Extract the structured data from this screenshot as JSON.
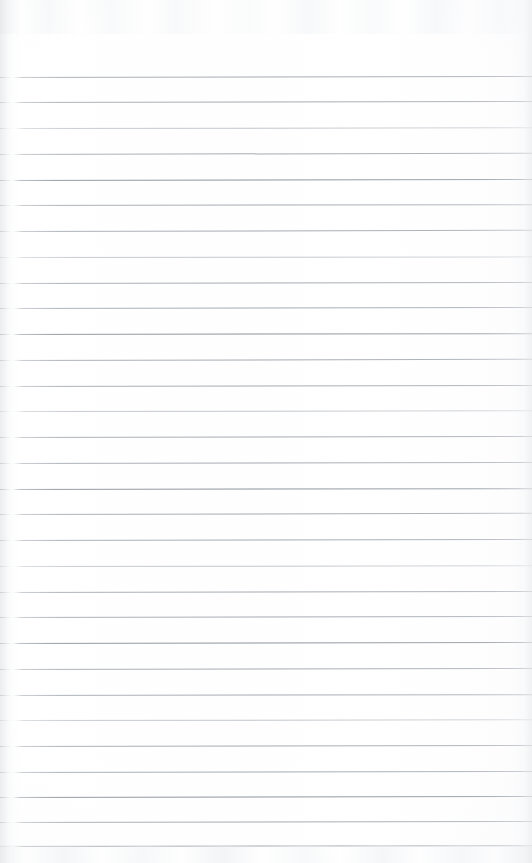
{
  "document": {
    "kind": "scanned-lined-paper",
    "title": "Blank Ruled Notebook Page",
    "description": "Scanned blank lined writing paper with no handwriting or printed text",
    "page_width": 532,
    "page_height": 863,
    "orientation": "portrait",
    "text_content": "",
    "has_handwriting": false,
    "has_printed_text": false
  },
  "colors": {
    "paper": "#fdfdfd",
    "paper_edge": "#f6f7f8",
    "rule_line": "#989ea5",
    "rule_line_strong": "#8a9198",
    "rule_line_faint": "#a8aeb4",
    "scan_noise": "#e9ecef"
  },
  "ruling": {
    "style": "wide-ruled horizontal lines",
    "line_count": 31,
    "first_line_y": 77,
    "last_line_y": 846,
    "spacing_px": 25.6,
    "line_thickness_px": 1,
    "margin_rule": "none",
    "left_inset_px": 0,
    "right_inset_px": 0,
    "lines": [
      {
        "y": 77,
        "weight": "normal",
        "skew": -0.1
      },
      {
        "y": 102,
        "weight": "normal",
        "skew": -0.12
      },
      {
        "y": 128,
        "weight": "faint",
        "skew": -0.08
      },
      {
        "y": 154,
        "weight": "normal",
        "skew": -0.14
      },
      {
        "y": 180,
        "weight": "strong",
        "skew": -0.1
      },
      {
        "y": 205,
        "weight": "normal",
        "skew": -0.09
      },
      {
        "y": 231,
        "weight": "normal",
        "skew": -0.13
      },
      {
        "y": 257,
        "weight": "faint",
        "skew": -0.07
      },
      {
        "y": 283,
        "weight": "normal",
        "skew": -0.11
      },
      {
        "y": 308,
        "weight": "normal",
        "skew": -0.12
      },
      {
        "y": 334,
        "weight": "strong",
        "skew": -0.09
      },
      {
        "y": 360,
        "weight": "normal",
        "skew": -0.13
      },
      {
        "y": 386,
        "weight": "normal",
        "skew": -0.1
      },
      {
        "y": 411,
        "weight": "faint",
        "skew": -0.08
      },
      {
        "y": 437,
        "weight": "normal",
        "skew": -0.12
      },
      {
        "y": 463,
        "weight": "normal",
        "skew": -0.11
      },
      {
        "y": 489,
        "weight": "strong",
        "skew": -0.09
      },
      {
        "y": 514,
        "weight": "normal",
        "skew": -0.13
      },
      {
        "y": 540,
        "weight": "normal",
        "skew": -0.1
      },
      {
        "y": 566,
        "weight": "faint",
        "skew": -0.08
      },
      {
        "y": 592,
        "weight": "normal",
        "skew": -0.12
      },
      {
        "y": 617,
        "weight": "normal",
        "skew": -0.11
      },
      {
        "y": 643,
        "weight": "strong",
        "skew": -0.1
      },
      {
        "y": 669,
        "weight": "normal",
        "skew": -0.12
      },
      {
        "y": 695,
        "weight": "normal",
        "skew": -0.09
      },
      {
        "y": 720,
        "weight": "faint",
        "skew": -0.08
      },
      {
        "y": 746,
        "weight": "normal",
        "skew": -0.12
      },
      {
        "y": 772,
        "weight": "normal",
        "skew": -0.11
      },
      {
        "y": 797,
        "weight": "strong",
        "skew": -0.1
      },
      {
        "y": 822,
        "weight": "normal",
        "skew": -0.12
      },
      {
        "y": 846,
        "weight": "normal",
        "skew": -0.09
      }
    ]
  }
}
